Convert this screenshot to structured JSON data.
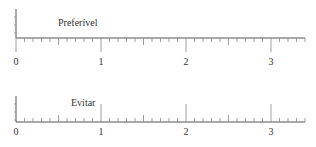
{
  "panels": [
    {
      "label": "Preferível",
      "tick_direction": "down",
      "axis_labels": [
        "0",
        "1",
        "2",
        "3"
      ]
    },
    {
      "label": "Evitar",
      "tick_direction": "up",
      "axis_labels": [
        "0",
        "1",
        "2",
        "3"
      ]
    }
  ],
  "scale": {
    "min": 0,
    "max": 3.4,
    "major_step": 1,
    "minor_step": 0.1
  },
  "colors": {
    "line": "#555555",
    "tick": "#888888",
    "text": "#333333"
  }
}
